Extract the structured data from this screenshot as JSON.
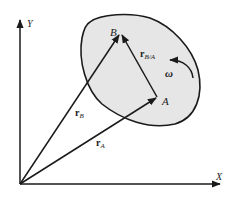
{
  "diagram": {
    "axes": {
      "x_label": "X",
      "y_label": "Y"
    },
    "points": {
      "A": {
        "label": "A"
      },
      "B": {
        "label": "B"
      }
    },
    "vectors": {
      "rA": {
        "base": "r",
        "sub": "A"
      },
      "rB": {
        "base": "r",
        "sub": "B"
      },
      "rBA": {
        "base": "r",
        "sub": "B/A"
      }
    },
    "angular_velocity": {
      "label": "ω"
    },
    "colors": {
      "body_fill": "#e6e6e6",
      "stroke": "#1a1a1a",
      "background": "#ffffff"
    }
  }
}
